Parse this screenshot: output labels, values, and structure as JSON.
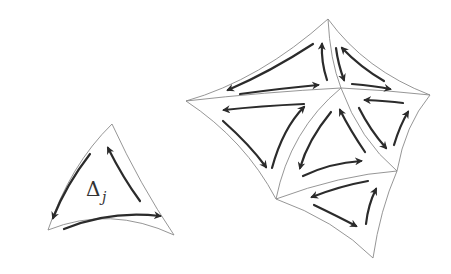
{
  "diagram": {
    "title": "",
    "single_triangle": {
      "label": "Δ",
      "subscript": "j"
    },
    "colors": {
      "edge": "#8a8a8a",
      "arrow": "#2b2b2b",
      "background": "#ffffff"
    }
  }
}
